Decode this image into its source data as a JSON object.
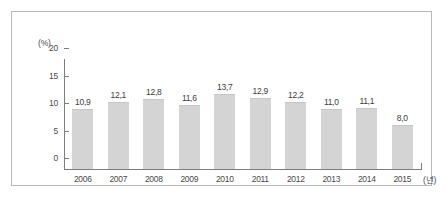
{
  "figure": {
    "frame_color": "#b9b9b9",
    "background": "#ffffff"
  },
  "chart_data": {
    "type": "bar",
    "title": "",
    "subtitle": "",
    "xlabel": "(년)",
    "ylabel": "(%)",
    "categories": [
      "2006",
      "2007",
      "2008",
      "2009",
      "2010",
      "2011",
      "2012",
      "2013",
      "2014",
      "2015"
    ],
    "values": [
      10.9,
      12.1,
      12.8,
      11.6,
      13.7,
      12.9,
      12.2,
      11.0,
      11.1,
      8.0
    ],
    "value_labels": [
      "10,9",
      "12,1",
      "12,8",
      "11,6",
      "13,7",
      "12,9",
      "12,2",
      "11,0",
      "11,1",
      "8,0"
    ],
    "ylim": [
      0,
      20
    ],
    "yticks": [
      0,
      5,
      10,
      15,
      20
    ],
    "ytick_labels": [
      "0",
      "5",
      "10",
      "15",
      "20"
    ],
    "grid": false,
    "legend": null,
    "bar_color": "#d4d4d4",
    "axis_color": "#7d7d7d",
    "decimal_separator": ","
  }
}
